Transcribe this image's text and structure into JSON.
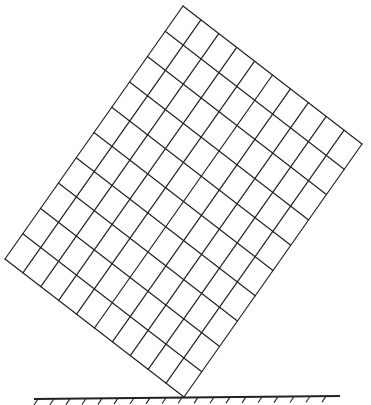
{
  "diagram": {
    "grid": {
      "corners": {
        "top": [
          183,
          6
        ],
        "right": [
          362,
          144
        ],
        "bottom": [
          184,
          397
        ],
        "left": [
          5,
          259
        ]
      },
      "divisions_top_edge": 10,
      "divisions_left_edge": 10,
      "stroke": "#222222"
    },
    "ground": {
      "x_start": 34,
      "x_end": 340,
      "y_left": 399,
      "y_right": 396,
      "hatch_spacing": 16,
      "stroke": "#222222"
    }
  }
}
